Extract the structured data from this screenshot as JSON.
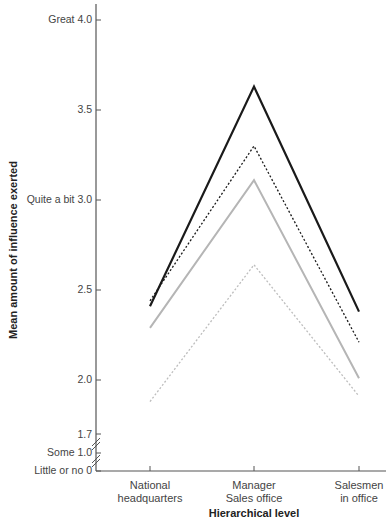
{
  "chart_data": {
    "type": "line",
    "title": "",
    "xlabel": "Hierarchical level",
    "ylabel": "Mean amount of influence exerted",
    "categories": [
      "National headquarters",
      "Manager Sales office",
      "Salesmen in office"
    ],
    "category_lines": [
      [
        "National",
        "headquarters"
      ],
      [
        "Manager",
        "Sales office"
      ],
      [
        "Salesmen",
        "in office"
      ]
    ],
    "y_ticks": [
      {
        "value": 4.0,
        "label": "Great 4.0"
      },
      {
        "value": 3.5,
        "label": "3.5"
      },
      {
        "value": 3.0,
        "label": "Quite a bit 3.0"
      },
      {
        "value": 2.5,
        "label": "2.5"
      },
      {
        "value": 2.0,
        "label": "2.0"
      },
      {
        "value": 1.7,
        "label": "1.7"
      },
      {
        "value": 1.0,
        "label": "Some 1.0"
      },
      {
        "value": 0,
        "label": "Little or no 0"
      }
    ],
    "ylim": [
      0,
      4.0
    ],
    "axis_break": "between 0 and 1.7 (broken axis marks)",
    "grid": false,
    "legend": null,
    "series": [
      {
        "name": "Series 1 (solid black)",
        "style": "solid",
        "color": "#1a1a1a",
        "values": [
          2.41,
          3.63,
          2.38
        ]
      },
      {
        "name": "Series 2 (dotted black)",
        "style": "dotted",
        "color": "#1a1a1a",
        "values": [
          2.44,
          3.3,
          2.21
        ]
      },
      {
        "name": "Series 3 (solid gray)",
        "style": "solid",
        "color": "#b5b5b5",
        "values": [
          2.29,
          3.11,
          2.01
        ]
      },
      {
        "name": "Series 4 (dotted gray)",
        "style": "dotted",
        "color": "#bdbdbd",
        "values": [
          1.88,
          2.64,
          1.91
        ]
      }
    ]
  },
  "labels": {
    "ylabel": "Mean amount of influence exerted",
    "xlabel": "Hierarchical level",
    "ticks": {
      "t40": "Great 4.0",
      "t35": "3.5",
      "t30": "Quite a bit 3.0",
      "t25": "2.5",
      "t20": "2.0",
      "t17": "1.7",
      "t10": "Some 1.0",
      "t0": "Little or no 0"
    },
    "categories": {
      "c1a": "National",
      "c1b": "headquarters",
      "c2a": "Manager",
      "c2b": "Sales office",
      "c3a": "Salesmen",
      "c3b": "in office"
    }
  }
}
